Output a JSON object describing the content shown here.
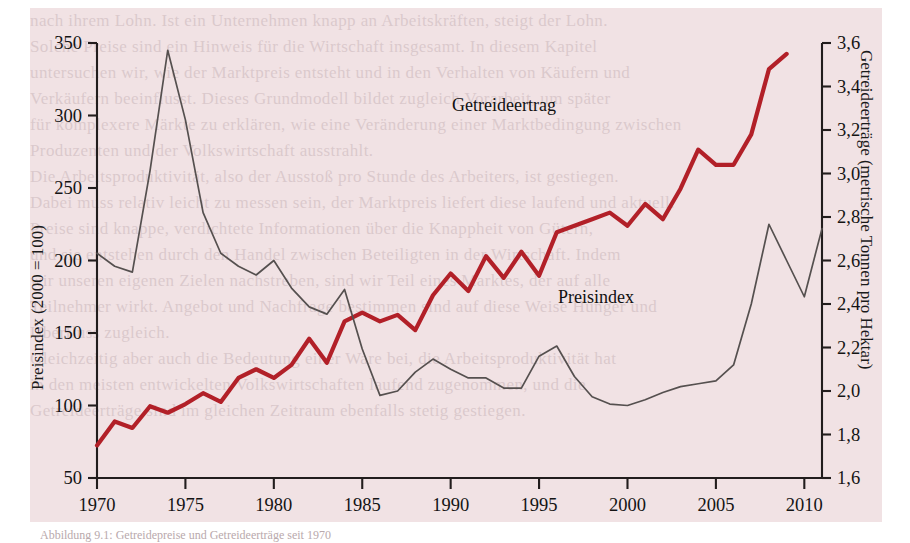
{
  "figure": {
    "background_color": "#f1e2e4",
    "page_color": "#ffffff",
    "caption": "Abbildung 9.1: Getreidepreise und Getreideerträge seit 1970"
  },
  "axes": {
    "left": {
      "title": "Preisindex (2000 = 100)",
      "ticks": [
        "350",
        "300",
        "250",
        "200",
        "150",
        "100",
        "50"
      ],
      "min": 50,
      "max": 350
    },
    "right": {
      "title": "Getreideerträge (metrische Tonnen pro Hektar)",
      "ticks": [
        "3,6",
        "3,4",
        "3,2",
        "3,0",
        "2,8",
        "2,6",
        "2,4",
        "2,2",
        "2,0",
        "1,8",
        "1,6"
      ],
      "min": 1.6,
      "max": 3.6
    },
    "bottom": {
      "ticks": [
        "1970",
        "1975",
        "1980",
        "1985",
        "1990",
        "1995",
        "2000",
        "2005",
        "2010"
      ],
      "min": 1970,
      "max": 2011
    }
  },
  "annotations": {
    "yield_label": "Getreideertrag",
    "price_label": "Preisindex"
  },
  "colors": {
    "yield_line": "#b22028",
    "price_line": "#55504f",
    "axis": "#221d1d",
    "panel": "#f1e2e4"
  },
  "bleed_text": [
    "nach ihrem Lohn. Ist ein Unternehmen knapp an Arbeitskräften, steigt der Lohn.",
    "Solche Preise sind ein Hinweis für die Wirtschaft insgesamt. In diesem Kapitel",
    "untersuchen wir, wie der Marktpreis entsteht und in den Verhalten von Käufern und",
    "Verkäufern beeinflusst. Dieses Grundmodell bildet zugleich Vorarbeit, um später",
    "für komplexere Märkte zu erklären, wie eine Veränderung einer Marktbedingung zwischen",
    "Produzenten und der Volkswirtschaft ausstrahlt.",
    "Die Arbeitsproduktivität, also der Ausstoß pro Stunde des Arbeiters, ist gestiegen.",
    "Dabei muss relativ leicht zu messen sein, der Marktpreis liefert diese laufend und aktuell.",
    "Preise sind knappe, verdichtete Informationen über die Knappheit von Gütern,",
    "und sie entstehen durch den Handel zwischen Beteiligten in der Wirtschaft. Indem",
    "wir unseren eigenen Zielen nachstreben, sind wir Teil eines Marktes, der auf alle",
    "Teilnehmer wirkt. Angebot und Nachfrage bestimmen sind auf diese Weise Hunger und",
    "Überfluss zugleich.",
    "Gleichzeitig aber auch die Bedeutung einer Ware bei, die Arbeitsproduktivität hat",
    "in den meisten entwickelten Volkswirtschaften laufend zugenommen, und die",
    "Getreideerträge sind im gleichen Zeitraum ebenfalls stetig gestiegen."
  ],
  "chart_data": {
    "type": "line",
    "title": "",
    "xlabel": "",
    "ylabel": "Preisindex (2000 = 100)",
    "ylabel_right": "Getreideerträge (metrische Tonnen pro Hektar)",
    "xlim": [
      1970,
      2011
    ],
    "ylim": [
      50,
      350
    ],
    "ylim_right": [
      1.6,
      3.6
    ],
    "grid": false,
    "legend": "inline-annotations",
    "series": [
      {
        "name": "Getreideertrag",
        "axis": "right",
        "color": "#b22028",
        "unit": "metrische Tonnen pro Hektar",
        "x": [
          1970,
          1971,
          1972,
          1973,
          1974,
          1975,
          1976,
          1977,
          1978,
          1979,
          1980,
          1981,
          1982,
          1983,
          1984,
          1985,
          1986,
          1987,
          1988,
          1989,
          1990,
          1991,
          1992,
          1993,
          1994,
          1995,
          1996,
          1997,
          1998,
          1999,
          2000,
          2001,
          2002,
          2003,
          2004,
          2005,
          2006,
          2007,
          2008,
          2009
        ],
        "values": [
          1.75,
          1.86,
          1.83,
          1.93,
          1.9,
          1.94,
          1.99,
          1.95,
          2.06,
          2.1,
          2.06,
          2.12,
          2.24,
          2.13,
          2.32,
          2.36,
          2.32,
          2.35,
          2.28,
          2.44,
          2.54,
          2.46,
          2.62,
          2.52,
          2.64,
          2.53,
          2.73,
          2.76,
          2.79,
          2.82,
          2.76,
          2.86,
          2.79,
          2.93,
          3.11,
          3.04,
          3.04,
          3.18,
          3.48,
          3.55
        ]
      },
      {
        "name": "Preisindex",
        "axis": "left",
        "color": "#55504f",
        "unit": "2000 = 100",
        "x": [
          1970,
          1971,
          1972,
          1973,
          1974,
          1975,
          1976,
          1977,
          1978,
          1979,
          1980,
          1981,
          1982,
          1983,
          1984,
          1985,
          1986,
          1987,
          1988,
          1989,
          1990,
          1991,
          1992,
          1993,
          1994,
          1995,
          1996,
          1997,
          1998,
          1999,
          2000,
          2001,
          2002,
          2003,
          2004,
          2005,
          2006,
          2007,
          2008,
          2009,
          2010,
          2011
        ],
        "values": [
          205,
          196,
          192,
          262,
          345,
          297,
          233,
          205,
          196,
          190,
          200,
          181,
          168,
          163,
          180,
          139,
          107,
          110,
          123,
          132,
          125,
          119,
          119,
          112,
          112,
          134,
          141,
          120,
          106,
          101,
          100,
          104,
          109,
          113,
          115,
          117,
          128,
          170,
          225,
          200,
          175,
          222
        ]
      }
    ]
  }
}
